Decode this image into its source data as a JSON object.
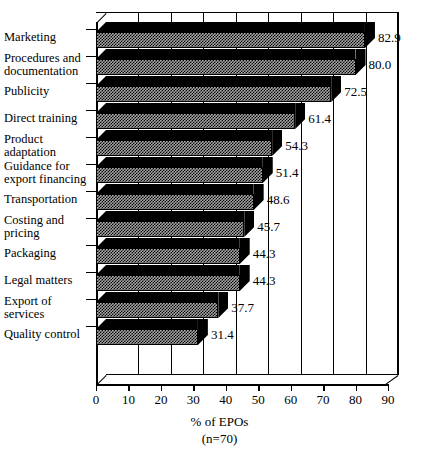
{
  "chart_data": {
    "type": "bar",
    "orientation": "horizontal",
    "title": "",
    "xlabel": "% of EPOs",
    "xlabel_note": "(n=70)",
    "ylabel": "",
    "xlim": [
      0,
      90
    ],
    "xticks": [
      0,
      10,
      20,
      30,
      40,
      50,
      60,
      70,
      80,
      90
    ],
    "grid": "vertical",
    "legend": "none",
    "style3d": true,
    "categories": [
      "Marketing",
      "Procedures and documentation",
      "Publicity",
      "Direct training",
      "Product adaptation",
      "Guidance for export financing",
      "Transportation",
      "Costing and pricing",
      "Packaging",
      "Legal matters",
      "Export of services",
      "Quality control"
    ],
    "values": [
      82.9,
      80.0,
      72.5,
      61.4,
      54.3,
      51.4,
      48.6,
      45.7,
      44.3,
      44.3,
      37.7,
      31.4
    ],
    "value_labels": [
      "82.9",
      "80.0",
      "72.5",
      "61.4",
      "54.3",
      "51.4",
      "48.6",
      "45.7",
      "44.3",
      "44.3",
      "37.7",
      "31.4"
    ],
    "category_lines": [
      [
        "Marketing"
      ],
      [
        "Procedures and",
        "documentation"
      ],
      [
        "Publicity"
      ],
      [
        "Direct training"
      ],
      [
        "Product",
        "adaptation"
      ],
      [
        "Guidance for",
        "export financing"
      ],
      [
        "Transportation"
      ],
      [
        "Costing and",
        "pricing"
      ],
      [
        "Packaging"
      ],
      [
        "Legal matters"
      ],
      [
        "Export of",
        "services"
      ],
      [
        "Quality control"
      ]
    ],
    "colors": {
      "bar_front": "#a6a6a6",
      "bar_top": "#000000",
      "axis": "#000000",
      "background": "#ffffff",
      "text": "#000000"
    }
  }
}
